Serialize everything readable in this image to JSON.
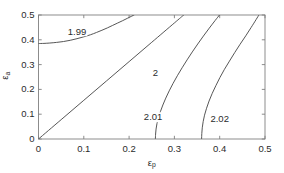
{
  "chart_data": {
    "type": "line",
    "title": "",
    "xlabel": "εp",
    "ylabel": "εa",
    "xlabel_base": "ε",
    "xlabel_sub": "p",
    "ylabel_base": "ε",
    "ylabel_sub": "a",
    "xlim": [
      0,
      0.5
    ],
    "ylim": [
      0,
      0.5
    ],
    "xticks": [
      0,
      0.1,
      0.2,
      0.3,
      0.4,
      0.5
    ],
    "xtick_labels": [
      "0",
      "0.1",
      "0.2",
      "0.3",
      "0.4",
      "0.5"
    ],
    "yticks": [
      0,
      0.1,
      0.2,
      0.3,
      0.4,
      0.5
    ],
    "ytick_labels": [
      "0",
      "0.1",
      "0.2",
      "0.3",
      "0.4",
      "0.5"
    ],
    "grid": false,
    "legend": "none",
    "line_color": "#4d4d4d",
    "axis_color": "#808080",
    "text_color": "#2b2b2b",
    "series": [
      {
        "name": "1.99",
        "label": "1.99",
        "label_x": 0.085,
        "label_y": 0.432,
        "points": [
          [
            0.0,
            0.385
          ],
          [
            0.012,
            0.3855
          ],
          [
            0.025,
            0.387
          ],
          [
            0.04,
            0.3895
          ],
          [
            0.055,
            0.393
          ],
          [
            0.07,
            0.398
          ],
          [
            0.085,
            0.4045
          ],
          [
            0.1,
            0.412
          ],
          [
            0.115,
            0.4205
          ],
          [
            0.128,
            0.4295
          ],
          [
            0.14,
            0.4385
          ],
          [
            0.152,
            0.448
          ],
          [
            0.163,
            0.4575
          ],
          [
            0.174,
            0.467
          ],
          [
            0.185,
            0.4765
          ],
          [
            0.196,
            0.4865
          ],
          [
            0.206,
            0.4955
          ],
          [
            0.211,
            0.5
          ]
        ]
      },
      {
        "name": "2",
        "label": "2",
        "label_x": 0.258,
        "label_y": 0.268,
        "points": [
          [
            0.0,
            0.0
          ],
          [
            0.05,
            0.078
          ],
          [
            0.1,
            0.156
          ],
          [
            0.15,
            0.234
          ],
          [
            0.2,
            0.312
          ],
          [
            0.25,
            0.39
          ],
          [
            0.3,
            0.468
          ],
          [
            0.3205,
            0.5
          ]
        ]
      },
      {
        "name": "2.01",
        "label": "2.01",
        "label_x": 0.253,
        "label_y": 0.087,
        "points": [
          [
            0.258,
            0.0
          ],
          [
            0.2585,
            0.02
          ],
          [
            0.2595,
            0.04
          ],
          [
            0.2615,
            0.062
          ],
          [
            0.2645,
            0.085
          ],
          [
            0.269,
            0.11
          ],
          [
            0.2745,
            0.137
          ],
          [
            0.281,
            0.165
          ],
          [
            0.2885,
            0.194
          ],
          [
            0.297,
            0.224
          ],
          [
            0.3065,
            0.255
          ],
          [
            0.317,
            0.287
          ],
          [
            0.328,
            0.319
          ],
          [
            0.3395,
            0.351
          ],
          [
            0.3515,
            0.383
          ],
          [
            0.364,
            0.415
          ],
          [
            0.377,
            0.447
          ],
          [
            0.39,
            0.478
          ],
          [
            0.3995,
            0.5
          ]
        ]
      },
      {
        "name": "2.02",
        "label": "2.02",
        "label_x": 0.4,
        "label_y": 0.082,
        "points": [
          [
            0.36,
            0.0
          ],
          [
            0.3605,
            0.022
          ],
          [
            0.3615,
            0.045
          ],
          [
            0.3635,
            0.07
          ],
          [
            0.3665,
            0.096
          ],
          [
            0.371,
            0.124
          ],
          [
            0.3765,
            0.153
          ],
          [
            0.3835,
            0.184
          ],
          [
            0.3915,
            0.215
          ],
          [
            0.4005,
            0.248
          ],
          [
            0.4105,
            0.281
          ],
          [
            0.4215,
            0.314
          ],
          [
            0.433,
            0.348
          ],
          [
            0.445,
            0.382
          ],
          [
            0.4575,
            0.416
          ],
          [
            0.4695,
            0.45
          ],
          [
            0.4805,
            0.482
          ],
          [
            0.4865,
            0.5
          ]
        ]
      }
    ]
  }
}
